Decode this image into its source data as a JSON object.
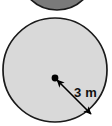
{
  "figure": {
    "background_color": "#ffffff"
  },
  "shapes": {
    "upper_circle": {
      "name": "partial-circle-top",
      "fill_color": "#7a7a7a",
      "stroke_color": "#1a1a1a",
      "center_x": 57,
      "center_y": -28,
      "radius": 38,
      "note": "cropped by top edge, only lower arc visible"
    },
    "main_circle": {
      "name": "main-circle",
      "fill_color": "#d9d9d9",
      "stroke_color": "#1a1a1a",
      "center_x": 55,
      "center_y": 70,
      "radius": 52
    }
  },
  "annotations": {
    "center_dot": {
      "name": "center-point",
      "color": "#000000",
      "x": 55,
      "y": 78,
      "radius": 3.4
    },
    "radius_arrow": {
      "name": "radius-arrow",
      "color": "#000000",
      "start_x": 57,
      "start_y": 80,
      "end_x": 91,
      "end_y": 114,
      "double_headed": true,
      "stroke_width": 1.6
    },
    "radius_label": {
      "name": "radius-label",
      "text": "3 m",
      "value": 3,
      "unit": "m",
      "x": 74,
      "y": 93,
      "color": "#111111"
    }
  }
}
